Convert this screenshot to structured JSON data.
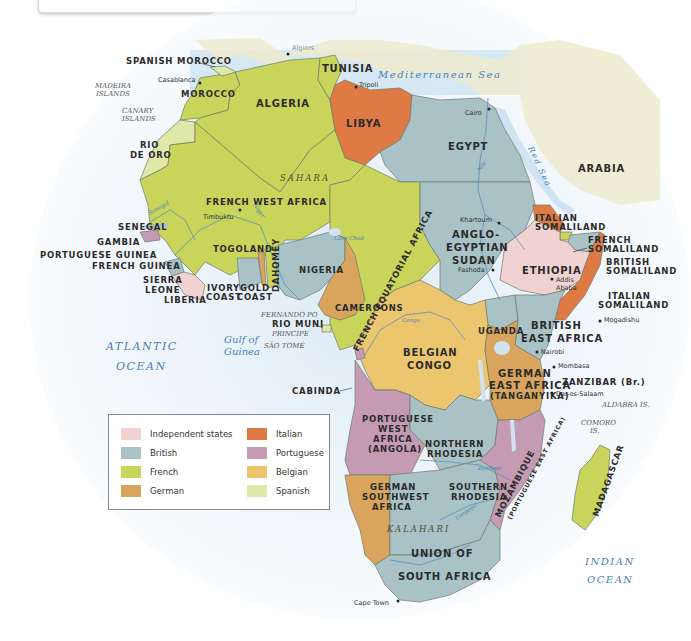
{
  "colors": {
    "independent": "#f0d3d0",
    "british": "#a9c2c6",
    "french": "#c9d45a",
    "german": "#d9a55c",
    "italian": "#e07a45",
    "portuguese": "#c59ab3",
    "belgian": "#ecc66e",
    "spanish": "#dfe8a8",
    "sea": "#cfe3f3",
    "arabia": "#eeebcf"
  },
  "legend": {
    "items": [
      {
        "label": "Independent states",
        "color": "#f0d3d0"
      },
      {
        "label": "British",
        "color": "#a9c2c6"
      },
      {
        "label": "French",
        "color": "#c9d45a"
      },
      {
        "label": "German",
        "color": "#d9a55c"
      },
      {
        "label": "Italian",
        "color": "#e07a45"
      },
      {
        "label": "Portuguese",
        "color": "#c59ab3"
      },
      {
        "label": "Belgian",
        "color": "#ecc66e"
      },
      {
        "label": "Spanish",
        "color": "#dfe8a8"
      }
    ]
  },
  "territories": {
    "spanish_morocco": "SPANISH MOROCCO",
    "morocco": "MOROCCO",
    "algeria": "ALGERIA",
    "tunisia": "TUNISIA",
    "libya": "LIBYA",
    "egypt": "EGYPT",
    "arabia": "ARABIA",
    "rio_de_oro_1": "RIO",
    "rio_de_oro_2": "DE ORO",
    "french_west_africa": "FRENCH WEST AFRICA",
    "senegal": "SENEGAL",
    "gambia": "GAMBIA",
    "portuguese_guinea": "PORTUGUESE GUINEA",
    "french_guinea": "FRENCH GUINEA",
    "sierra_leone_1": "SIERRA",
    "sierra_leone_2": "LEONE",
    "liberia": "LIBERIA",
    "togoland": "TOGOLAND",
    "dahomey": "DAHOMEY",
    "ivory_coast_1": "IVORY",
    "ivory_coast_2": "COAST",
    "gold_coast_1": "GOLD",
    "gold_coast_2": "COAST",
    "nigeria": "NIGERIA",
    "cameroons": "CAMEROONS",
    "french_equatorial_africa": "FRENCH EQUATORIAL AFRICA",
    "rio_muni": "RIO MUNI",
    "anglo_egyptian_sudan_1": "ANGLO-",
    "anglo_egyptian_sudan_2": "EGYPTIAN",
    "anglo_egyptian_sudan_3": "SUDAN",
    "italian_somaliland_n_1": "ITALIAN",
    "italian_somaliland_n_2": "SOMALILAND",
    "french_somaliland_1": "FRENCH",
    "french_somaliland_2": "SOMALILAND",
    "british_somaliland_1": "BRITISH",
    "british_somaliland_2": "SOMALILAND",
    "italian_somaliland_s_1": "ITALIAN",
    "italian_somaliland_s_2": "SOMALILAND",
    "ethiopia": "ETHIOPIA",
    "uganda": "UGANDA",
    "british_east_africa_1": "BRITISH",
    "british_east_africa_2": "EAST AFRICA",
    "belgian_congo_1": "BELGIAN",
    "belgian_congo_2": "CONGO",
    "german_east_africa_1": "GERMAN",
    "german_east_africa_2": "EAST AFRICA",
    "german_east_africa_3": "(TANGANYIKA)",
    "zanzibar": "ZANZIBAR (Br.)",
    "cabinda": "CABINDA",
    "portuguese_west_africa_1": "PORTUGUESE",
    "portuguese_west_africa_2": "WEST",
    "portuguese_west_africa_3": "AFRICA",
    "portuguese_west_africa_4": "(ANGOLA)",
    "northern_rhodesia_1": "NORTHERN",
    "northern_rhodesia_2": "RHODESIA",
    "german_southwest_africa_1": "GERMAN",
    "german_southwest_africa_2": "SOUTHWEST",
    "german_southwest_africa_3": "AFRICA",
    "southern_rhodesia_1": "SOUTHERN",
    "southern_rhodesia_2": "RHODESIA",
    "mozambique": "MOZAMBIQUE",
    "portuguese_east_africa": "(PORTUGUESE EAST AFRICA)",
    "madagascar": "MADAGASCAR",
    "union_sa_1": "UNION OF",
    "union_sa_2": "SOUTH AFRICA"
  },
  "cities": {
    "algiers": "Algiers",
    "casablanca": "Casablanca",
    "tripoli": "Tripoli",
    "cairo": "Cairo",
    "timbuktu": "Timbuktu",
    "khartoum": "Khartoum",
    "fashoda": "Fashoda",
    "addis_1": "Addis",
    "addis_2": "Ababa",
    "mogadishu": "Mogadishu",
    "nairobi": "Nairobi",
    "mombasa": "Mombasa",
    "dar": "Dar-es-Salaam",
    "cape_town": "Cape Town"
  },
  "islands": {
    "madeira_1": "MADEIRA",
    "madeira_2": "ISLANDS",
    "canary_1": "CANARY",
    "canary_2": "ISLANDS",
    "fernando_po": "FERNANDO PO",
    "principe": "PRINCIPE",
    "sao_tome": "SÃO TOMÉ",
    "aldabra": "ALDABRA IS.",
    "comoro_1": "COMORO",
    "comoro_2": "IS."
  },
  "water": {
    "mediterranean": "Mediterranean Sea",
    "red_sea": "Red Sea",
    "atlantic_1": "ATLANTIC",
    "atlantic_2": "OCEAN",
    "gulf_1": "Gulf of",
    "gulf_2": "Guinea",
    "indian_1": "INDIAN",
    "indian_2": "OCEAN",
    "lake_chad": "Lake Chad",
    "lake_victoria": "Lake Victoria",
    "lake_tanganyika": "Lake Tanganyika",
    "lake_nyasa": "Lake Nyasa"
  },
  "rivers": {
    "nile": "Nile",
    "blue_nile": "Blue Nile",
    "white_nile": "White Nile",
    "niger": "Niger",
    "senegal": "Senegal",
    "congo": "Congo",
    "zambezi": "Zambezi",
    "limpopo": "Limpopo",
    "orange": "Orange"
  },
  "regions": {
    "sahara": "SAHARA",
    "kalahari": "KALAHARI"
  }
}
